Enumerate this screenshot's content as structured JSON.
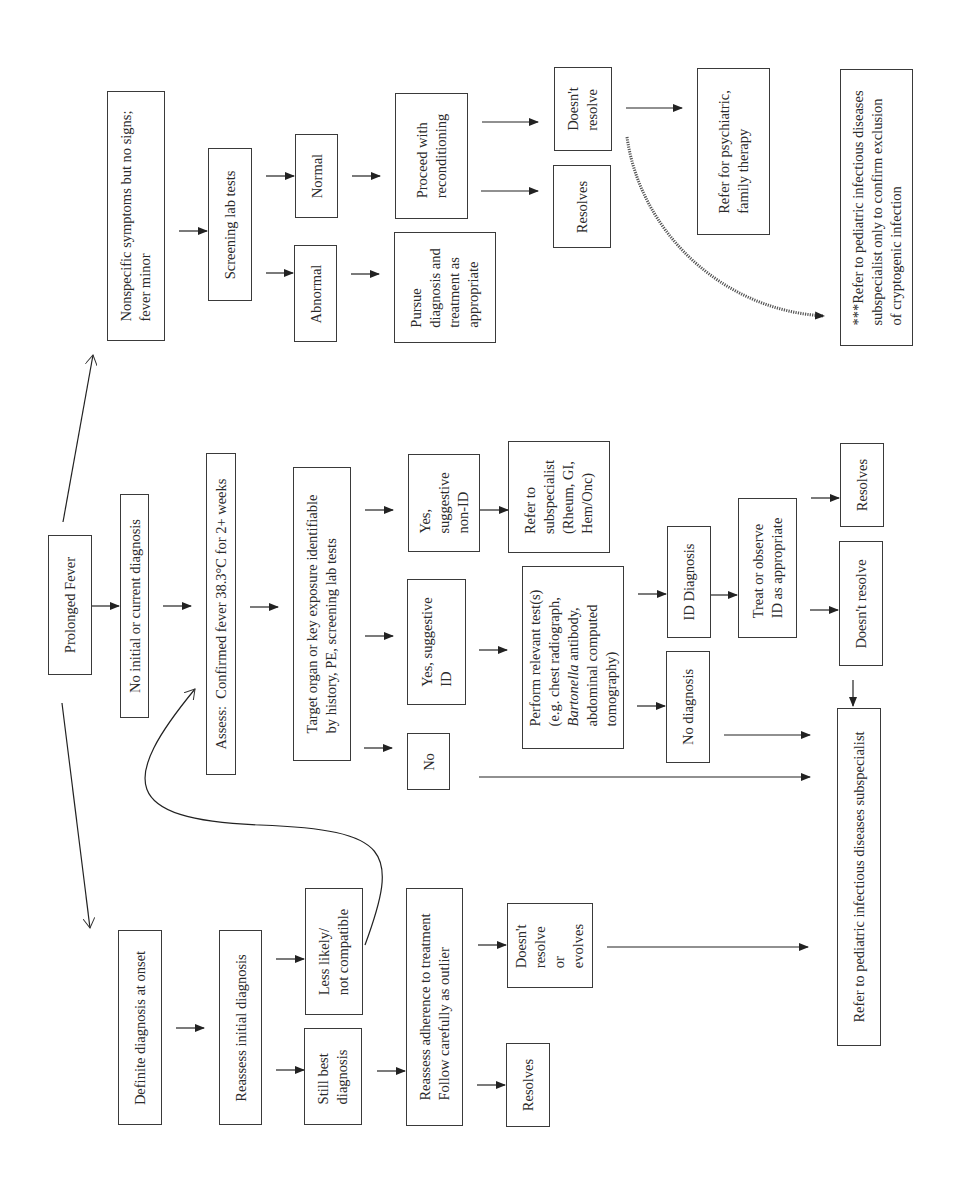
{
  "diagram": {
    "type": "flowchart",
    "orientation": "rotated-90-ccw",
    "root": "Prolonged Fever",
    "branches": {
      "nonspecific": {
        "label": "Nonspecific symptoms but no signs;\nfever minor",
        "screening": "Screening lab tests",
        "normal": "Normal",
        "abnormal": "Abnormal",
        "proceed": "Proceed with\nreconditioning",
        "pursue": "Pursue\ndiagnosis and\ntreatment as\nappropriate",
        "doesnt_resolve": "Doesn't\nresolve",
        "resolves": "Resolves",
        "refer_psych": "Refer for psychiatric,\nfamily therapy",
        "refer_id_note": "***Refer to pediatric infectious diseases\nsubspecialist only to confirm exclusion\nof cryptogenic infection"
      },
      "no_initial": {
        "label": "No initial or current diagnosis",
        "assess": "Assess:  Confirmed fever 38.3°C for 2+ weeks",
        "target": "Target organ or key exposure identifiable\nby history, PE, screening lab tests",
        "yes_non_id": "Yes,\nsuggestive\nnon-ID",
        "yes_id": "Yes, suggestive\nID",
        "no": "No",
        "refer_subspecialist": "Refer to\nsubspecialist\n(Rheum, GI,\nHem/Onc)",
        "perform_tests_line1": "Perform relevant test(s)\n(e.g. chest radiograph,",
        "perform_tests_italic": "Bartonella",
        "perform_tests_line3_rest": " antibody,",
        "perform_tests_line45": "abdominal computed\ntomography)",
        "id_diagnosis": "ID Diagnosis",
        "no_diagnosis": "No diagnosis",
        "treat": "Treat or observe\nID as appropriate",
        "resolves": "Resolves",
        "doesnt_resolve": "Doesn't resolve",
        "refer_id": "Refer to pediatric infectious diseases subspecialist"
      },
      "definite": {
        "label": "Definite diagnosis at onset",
        "reassess_initial": "Reassess initial diagnosis",
        "less_likely": "Less likely/\nnot compatible",
        "still_best": "Still best\ndiagnosis",
        "reassess_adherence": "Reassess adherence to treatment\nFollow carefully as outlier",
        "doesnt_resolve_evolves": "Doesn't\nresolve\nor\nevolves",
        "resolves": "Resolves"
      }
    }
  }
}
